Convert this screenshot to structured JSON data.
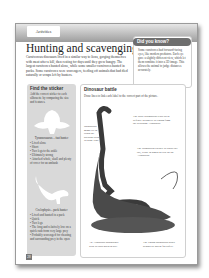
{
  "header": {
    "tab_label": "Activities"
  },
  "title": "Hunting and scavenging",
  "intro": "Carnivorous dinosaurs lived in a similar way to lions, gorging themselves with meat after a kill, then resting for days until they grew hungry. The largest carnivores hunted alone, while some smaller carnivores hunted in packs. Some carnivores were scavengers, feeding off animals that had died naturally or scraps left by hunters.",
  "did_you_know": {
    "heading": "Did you know?",
    "text": "Some carnivores had forward-facing eyes, like modern predators. Each eye gave a slightly different view, which let them combine it into a 3D image. This allows the animal to judge distances accurately."
  },
  "find_sticker": {
    "heading": "Find the sticker",
    "instructions": "Add the correct sticker to each silhouette by comparing the size and features.",
    "silhouette1": {
      "label": "Tyrannosaurus – fast hunter",
      "items": [
        "Lived alone",
        "Short",
        "Two legs to the ankle",
        "Ultimately strong",
        "Attacked whole, skull and plenty of cover for an ambush"
      ]
    },
    "silhouette2": {
      "label": "Coelophysis – pack hunter",
      "items": [
        "Lived and hunted in a pack",
        "Quick",
        "Two legs",
        "The long and relatively low on a quick rush from very large prey",
        "Probably scavenged for cheating and surrounding prey in the open"
      ]
    }
  },
  "dinosaur_battle": {
    "heading": "Dinosaur battle",
    "instructions": "Draw lines to link each label to the correct part of the picture.",
    "captions": {
      "left": "Barosaurus might try to crush the predator with its huge legs.",
      "top_right": "The adult Barosaurus rears up in defence to protect its young from the attacking Allosaurus.",
      "mid_right": "The Barosaurus swipes its whip-like tail, ready to knock or trip up the Allosaurus.",
      "bottom_left": "An Allosaurus approaches with its jaws open to bite.",
      "bottom_right": "The young Barosaurus hides behind its parent for safety."
    }
  },
  "page_number": "28"
}
